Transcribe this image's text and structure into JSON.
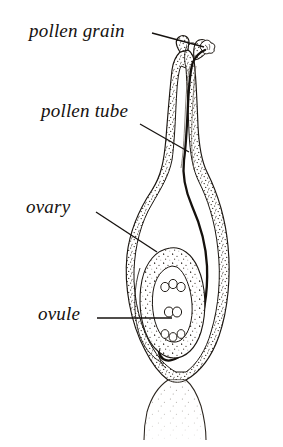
{
  "figure": {
    "type": "botanical-diagram",
    "background_color": "#ffffff",
    "ink_color": "#16120f"
  },
  "labels": [
    {
      "id": "pollen-grain",
      "text": "pollen grain"
    },
    {
      "id": "pollen-tube",
      "text": "pollen tube"
    },
    {
      "id": "ovary",
      "text": "ovary"
    },
    {
      "id": "ovule",
      "text": "ovule"
    }
  ],
  "leader_lines": [
    {
      "id": "pollen-grain",
      "from": [
        152,
        33
      ],
      "to": [
        204,
        47
      ]
    },
    {
      "id": "pollen-tube",
      "from": [
        140,
        124
      ],
      "to": [
        189,
        152
      ]
    },
    {
      "id": "ovary",
      "from": [
        96,
        212
      ],
      "to": [
        157,
        252
      ]
    },
    {
      "id": "ovule",
      "from": [
        97,
        318
      ],
      "to": [
        172,
        318
      ]
    }
  ],
  "structures": [
    {
      "id": "stigma",
      "name": "stigma"
    },
    {
      "id": "style",
      "name": "style"
    },
    {
      "id": "ovary-wall",
      "name": "ovary wall"
    },
    {
      "id": "ovary-cavity",
      "name": "ovary cavity"
    },
    {
      "id": "ovule-body",
      "name": "ovule"
    },
    {
      "id": "embryo-sac",
      "name": "embryo sac"
    },
    {
      "id": "antipodal-cells",
      "name": "antipodal cells",
      "count": 3
    },
    {
      "id": "polar-nuclei",
      "name": "polar nuclei",
      "count": 2
    },
    {
      "id": "egg-apparatus",
      "name": "egg apparatus",
      "count": 3
    },
    {
      "id": "pollen-grain-body",
      "name": "pollen grain"
    },
    {
      "id": "pollen-tube-path",
      "name": "pollen tube"
    },
    {
      "id": "stalk",
      "name": "stalk"
    }
  ]
}
